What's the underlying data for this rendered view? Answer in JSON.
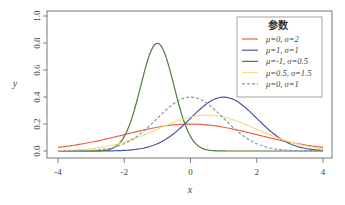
{
  "chart_data": {
    "type": "line",
    "title": "",
    "xlabel": "x",
    "ylabel": "y",
    "xlim": [
      -4,
      4
    ],
    "ylim": [
      0,
      1.0
    ],
    "grid": false,
    "legend_position": "top-right",
    "legend_title": "参数",
    "x_ticks": [
      -4,
      -2,
      0,
      2,
      4
    ],
    "x_tick_labels": [
      "-4",
      "-2",
      "0",
      "2",
      "4"
    ],
    "y_ticks": [
      0.0,
      0.2,
      0.4,
      0.6,
      0.8,
      1.0
    ],
    "y_tick_labels": [
      "0.0",
      "0.2",
      "0.4",
      "0.6",
      "0.8",
      "1.0"
    ],
    "series": [
      {
        "name": "μ=0, σ=2",
        "mu": 0,
        "sigma": 2,
        "color": "#e8604a",
        "dash": false,
        "peak": 0.199
      },
      {
        "name": "μ=1, σ=1",
        "mu": 1,
        "sigma": 1,
        "color": "#4b55a6",
        "dash": false,
        "peak": 0.399
      },
      {
        "name": "μ=-1, σ=0.5",
        "mu": -1,
        "sigma": 0.5,
        "color": "#4f7d3c",
        "dash": false,
        "peak": 0.798
      },
      {
        "name": "μ=0.5, σ=1.5",
        "mu": 0.5,
        "sigma": 1.5,
        "color": "#f3e07c",
        "dash": false,
        "peak": 0.266
      },
      {
        "name": "μ=0, σ=1",
        "mu": 0,
        "sigma": 1,
        "color": "#8c95aa",
        "dash": true,
        "peak": 0.399
      }
    ]
  }
}
